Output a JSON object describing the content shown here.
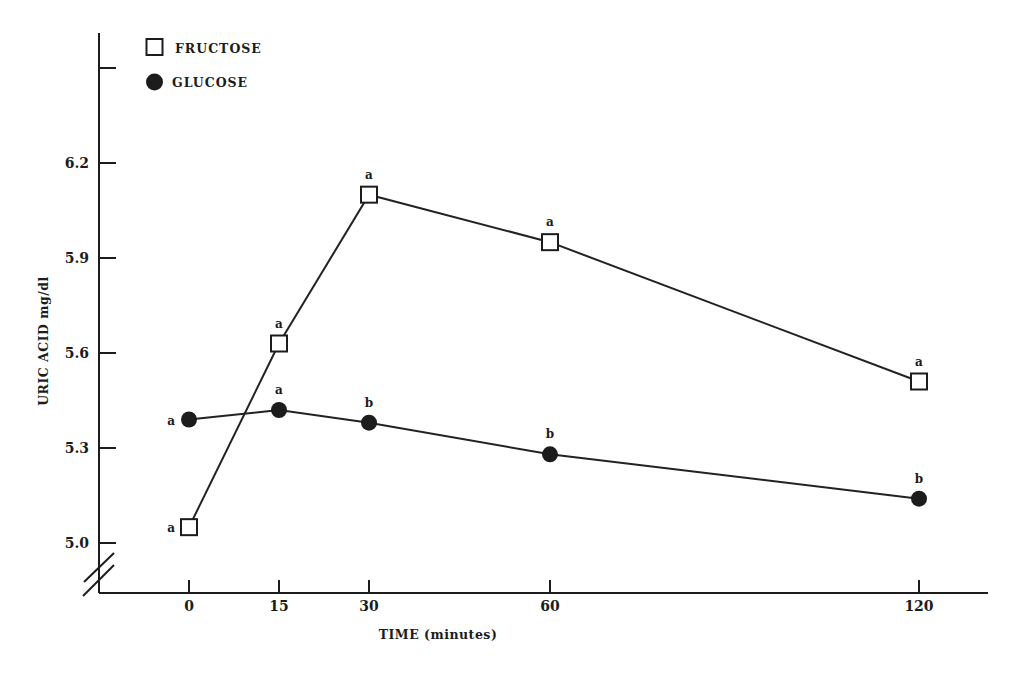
{
  "chart_data": {
    "type": "line",
    "title": "",
    "xlabel": "TIME (minutes)",
    "ylabel": "URIC ACID mg/dl",
    "x": [
      0,
      15,
      30,
      60,
      120
    ],
    "x_tick_labels": [
      "0",
      "15",
      "30",
      "60",
      "120"
    ],
    "y_ticks": [
      5.0,
      5.3,
      5.6,
      5.9,
      6.2,
      6.5
    ],
    "y_tick_labels": [
      "5.0",
      "5.3",
      "5.6",
      "5.9",
      "6.2",
      ""
    ],
    "ylim": [
      5.0,
      6.5
    ],
    "y_axis_break": true,
    "grid": false,
    "legend_position": "upper left",
    "series": [
      {
        "name": "FRUCTOSE",
        "marker": "open-square",
        "values": [
          5.05,
          5.63,
          6.1,
          5.95,
          5.51
        ],
        "significance_letters": [
          "a",
          "a",
          "a",
          "a",
          "a"
        ]
      },
      {
        "name": "GLUCOSE",
        "marker": "filled-circle",
        "values": [
          5.39,
          5.42,
          5.38,
          5.28,
          5.14
        ],
        "significance_letters": [
          "a",
          "a",
          "b",
          "b",
          "b"
        ]
      }
    ]
  },
  "legend": {
    "items": [
      {
        "label": "FRUCTOSE",
        "icon": "open-square-icon"
      },
      {
        "label": "GLUCOSE",
        "icon": "filled-circle-icon"
      }
    ]
  },
  "axes": {
    "x_title": "TIME (minutes)",
    "y_title": "URIC ACID mg/dl"
  },
  "colors": {
    "ink": "#1c1c1c",
    "background": "#ffffff"
  }
}
